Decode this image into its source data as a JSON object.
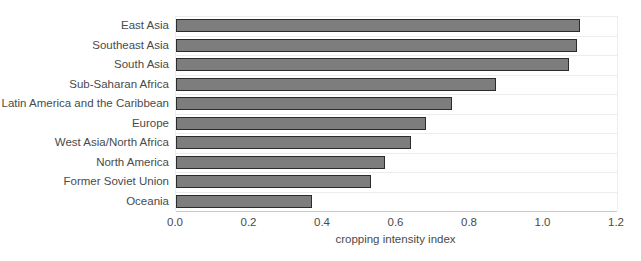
{
  "chart_data": {
    "type": "bar",
    "orientation": "horizontal",
    "title": "",
    "xlabel": "cropping intensity index",
    "ylabel": "",
    "categories": [
      "East Asia",
      "Southeast Asia",
      "South Asia",
      "Sub-Saharan Africa",
      "Latin America and the Caribbean",
      "Europe",
      "West Asia/North Africa",
      "North America",
      "Former Soviet Union",
      "Oceania"
    ],
    "values": [
      1.1,
      1.09,
      1.07,
      0.87,
      0.75,
      0.68,
      0.64,
      0.57,
      0.53,
      0.37
    ],
    "xlim": [
      0.0,
      1.2
    ],
    "xticks": [
      0.0,
      0.2,
      0.4,
      0.6,
      0.8,
      1.0,
      1.2
    ],
    "xtick_labels": [
      "0.0",
      "0.2",
      "0.4",
      "0.6",
      "0.8",
      "1.0",
      "1.2"
    ],
    "grid": "horizontal-row-separators",
    "legend": "none",
    "colors": {
      "bar_fill": "#7d7d7d",
      "bar_border": "#2b2b2b",
      "gridline": "#ececec",
      "axis_line": "#c9c9c9",
      "text": "#4a4a4a",
      "background": "#ffffff"
    }
  }
}
